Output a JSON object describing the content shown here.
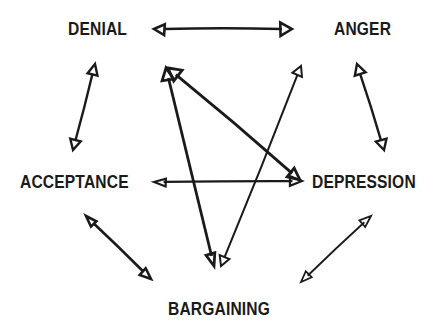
{
  "diagram": {
    "background_color": "#ffffff",
    "ink_color": "#1a1a1a",
    "style": "hand-drawn open-outline arrowheads, bold condensed uppercase labels",
    "nodes": [
      {
        "id": "denial",
        "label": "DENIAL",
        "x": 106,
        "y": 28
      },
      {
        "id": "anger",
        "label": "ANGER",
        "x": 372,
        "y": 28
      },
      {
        "id": "acceptance",
        "label": "ACCEPTANCE",
        "x": 76,
        "y": 182
      },
      {
        "id": "depression",
        "label": "DEPRESSION",
        "x": 376,
        "y": 182
      },
      {
        "id": "bargaining",
        "label": "BARGAINING",
        "x": 226,
        "y": 308
      }
    ],
    "edges": [
      {
        "id": "denial-anger",
        "from": "denial",
        "to": "anger",
        "direction": "bidirectional",
        "x1": 154,
        "y1": 29,
        "x2": 292,
        "y2": 29,
        "stroke_width": 2.6
      },
      {
        "id": "denial-acceptance",
        "from": "denial",
        "to": "acceptance",
        "direction": "bidirectional",
        "x1": 95,
        "y1": 64,
        "x2": 73,
        "y2": 150,
        "stroke_width": 2.4
      },
      {
        "id": "anger-depression",
        "from": "anger",
        "to": "depression",
        "direction": "bidirectional",
        "x1": 357,
        "y1": 64,
        "x2": 384,
        "y2": 150,
        "stroke_width": 2.4
      },
      {
        "id": "acceptance-bargaining",
        "from": "acceptance",
        "to": "bargaining",
        "direction": "bidirectional",
        "x1": 86,
        "y1": 216,
        "x2": 151,
        "y2": 279,
        "stroke_width": 2.6
      },
      {
        "id": "bargaining-depression",
        "from": "bargaining",
        "to": "depression",
        "direction": "bidirectional",
        "x1": 301,
        "y1": 282,
        "x2": 371,
        "y2": 216,
        "stroke_width": 1.8
      },
      {
        "id": "depression-acceptance",
        "from": "depression",
        "to": "acceptance",
        "direction": "bidirectional",
        "x1": 154,
        "y1": 182,
        "x2": 302,
        "y2": 181,
        "stroke_width": 2.2
      },
      {
        "id": "denial-bargaining",
        "from": "denial",
        "to": "bargaining",
        "direction": "bidirectional",
        "x1": 166,
        "y1": 68,
        "x2": 214,
        "y2": 266,
        "stroke_width": 2.8
      },
      {
        "id": "denial-depression",
        "from": "denial",
        "to": "depression",
        "direction": "bidirectional",
        "x1": 168,
        "y1": 68,
        "x2": 300,
        "y2": 180,
        "stroke_width": 2.8
      },
      {
        "id": "bargaining-anger",
        "from": "bargaining",
        "to": "anger",
        "direction": "bidirectional",
        "x1": 221,
        "y1": 266,
        "x2": 301,
        "y2": 66,
        "stroke_width": 2.0
      }
    ]
  }
}
